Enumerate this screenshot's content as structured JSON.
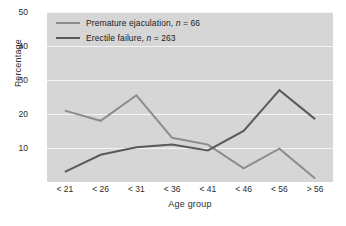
{
  "chart_data": {
    "type": "line",
    "title": "",
    "xlabel": "Age group",
    "ylabel": "Percentage",
    "categories": [
      "< 21",
      "< 26",
      "< 31",
      "< 36",
      "< 41",
      "< 46",
      "< 56",
      "> 56"
    ],
    "ylim": [
      0,
      50
    ],
    "yticks": [
      10,
      20,
      30,
      40,
      50
    ],
    "grid": "horizontal",
    "legend_position": "top-left",
    "plot_background": "#d6d6d6",
    "gridline_color": "#f4f4f4",
    "series": [
      {
        "name": "Premature ejaculation",
        "n": 66,
        "legend_label": "Premature ejaculation, n = 66",
        "color": "#8c8c8c",
        "values": [
          21.0,
          18.0,
          25.5,
          13.0,
          11.0,
          4.0,
          9.8,
          1.0
        ]
      },
      {
        "name": "Erectile failure",
        "n": 263,
        "legend_label": "Erectile failure, n = 263",
        "color": "#5a5a5a",
        "values": [
          3.0,
          8.0,
          10.2,
          11.0,
          9.3,
          15.0,
          27.0,
          18.5
        ]
      }
    ]
  },
  "legend": {
    "items": [
      {
        "label_main": "Premature ejaculation,",
        "label_n": "n",
        "label_value": "= 66"
      },
      {
        "label_main": "Erectile failure,",
        "label_n": "n",
        "label_value": "= 263"
      }
    ]
  }
}
